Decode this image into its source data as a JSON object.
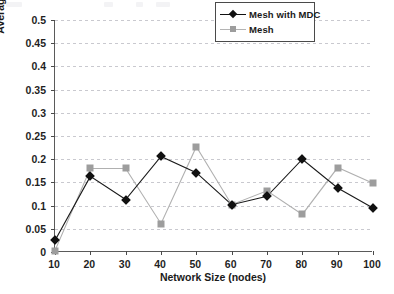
{
  "chart_data": {
    "type": "line",
    "title": "",
    "xlabel": "Network Size (nodes)",
    "ylabel": "Average end-to-end delay ( s )",
    "x": [
      10,
      20,
      30,
      40,
      50,
      60,
      70,
      80,
      90,
      100
    ],
    "categories": [
      "10",
      "20",
      "30",
      "40",
      "50",
      "60",
      "70",
      "80",
      "90",
      "100"
    ],
    "series": [
      {
        "name": "Mesh with MDC",
        "color": "#111111",
        "marker": "diamond",
        "values": [
          0.025,
          0.163,
          0.113,
          0.206,
          0.171,
          0.102,
          0.12,
          0.2,
          0.138,
          0.095
        ]
      },
      {
        "name": "Mesh",
        "color": "#9d9d9d",
        "marker": "square",
        "values": [
          0.003,
          0.18,
          0.18,
          0.061,
          0.227,
          0.102,
          0.132,
          0.081,
          0.182,
          0.148
        ]
      }
    ],
    "xlim": [
      10,
      100
    ],
    "ylim": [
      0,
      0.5
    ],
    "ytick_labels": [
      "0.5",
      "0.45",
      "0.4",
      "0.35",
      "0.3",
      "0.25",
      "0.2",
      "0.15",
      "0.1",
      "0.05",
      "0"
    ],
    "ytick_values": [
      0.5,
      0.45,
      0.4,
      0.35,
      0.3,
      0.25,
      0.2,
      0.15,
      0.1,
      0.05,
      0
    ],
    "xtick_labels": [
      "10",
      "20",
      "30",
      "40",
      "50",
      "60",
      "70",
      "80",
      "90",
      "100"
    ],
    "grid": true,
    "grid_axis": "y",
    "legend_position": "top-right",
    "legend_entries": [
      "Mesh with MDC",
      "Mesh"
    ]
  }
}
